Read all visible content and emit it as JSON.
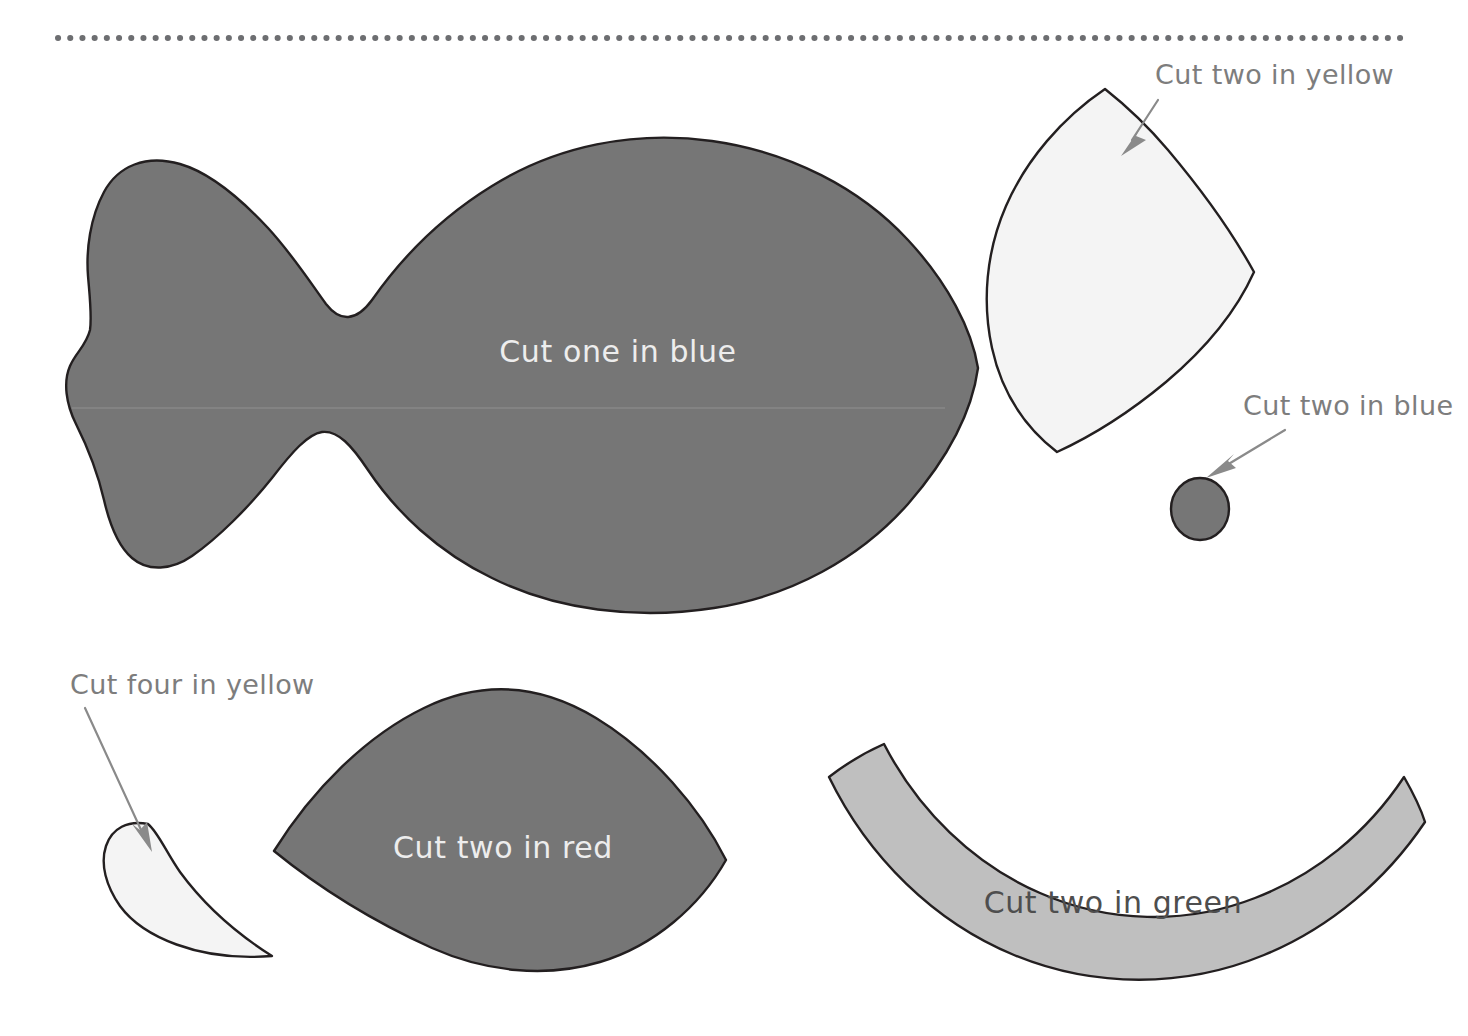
{
  "page": {
    "background_color": "#ffffff",
    "width": 1468,
    "height": 1036
  },
  "divider": {
    "name": "dotted-cut-rule",
    "color": "#6d6e71",
    "y": 38,
    "x_start": 58,
    "x_end": 1410
  },
  "palette": {
    "piece_dark": "#767676",
    "piece_mid": "#bfbfbf",
    "piece_pale": "#f4f4f4",
    "outline": "#231f20",
    "callout_text": "#7d7d7d",
    "light_text": "#ededed",
    "dark_text": "#4e4e4e",
    "fold_line": "#9c9c9c"
  },
  "pieces": [
    {
      "id": "fish-body",
      "name": "fish-body-piece",
      "label": "Cut one in blue",
      "label_placement": "inside",
      "fill": "#767676",
      "quantity": "one",
      "color_word": "blue",
      "label_x": 618,
      "label_y": 362
    },
    {
      "id": "dorsal-fin",
      "name": "dorsal-fin-piece",
      "label": "Cut two in yellow",
      "label_placement": "callout",
      "fill": "#f4f4f4",
      "quantity": "two",
      "color_word": "yellow",
      "label_x": 1155,
      "label_y": 84
    },
    {
      "id": "eye-dot",
      "name": "eye-dot-piece",
      "label": "Cut two in blue",
      "label_placement": "callout",
      "fill": "#767676",
      "quantity": "two",
      "color_word": "blue",
      "label_x": 1243,
      "label_y": 415
    },
    {
      "id": "small-teardrop",
      "name": "teardrop-piece",
      "label": "Cut four in yellow",
      "label_placement": "callout",
      "fill": "#f4f4f4",
      "quantity": "four",
      "color_word": "yellow",
      "label_x": 70,
      "label_y": 694
    },
    {
      "id": "lens-shape",
      "name": "lens-piece",
      "label": "Cut two in red",
      "label_placement": "inside",
      "fill": "#767676",
      "quantity": "two",
      "color_word": "red",
      "label_x": 503,
      "label_y": 858
    },
    {
      "id": "curved-band",
      "name": "curved-band-piece",
      "label": "Cut two in green",
      "label_placement": "inside",
      "fill": "#bfbfbf",
      "quantity": "two",
      "color_word": "green",
      "label_x": 1113,
      "label_y": 913
    }
  ],
  "callouts": [
    {
      "name": "callout-dorsal-fin",
      "from": {
        "x": 1155,
        "y": 96
      },
      "to": {
        "x": 1120,
        "y": 148
      }
    },
    {
      "name": "callout-eye-dot",
      "from": {
        "x": 1288,
        "y": 427
      },
      "to": {
        "x": 1205,
        "y": 473
      }
    },
    {
      "name": "callout-teardrop",
      "from": {
        "x": 88,
        "y": 706
      },
      "to": {
        "x": 150,
        "y": 844
      }
    }
  ]
}
